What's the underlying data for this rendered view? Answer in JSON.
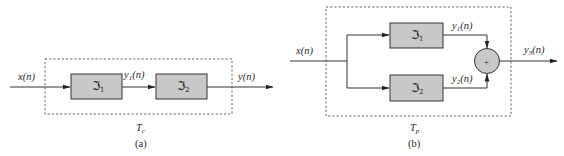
{
  "diagram_a": {
    "caption": "(a)",
    "system_label": "T",
    "system_label_sub": "c",
    "input_label": "x(n)",
    "intermediate_label": "y",
    "intermediate_sub": "1",
    "intermediate_suffix": "(n)",
    "output_label": "y(n)",
    "blocks": [
      {
        "symbol": "ℑ",
        "sub": "1"
      },
      {
        "symbol": "ℑ",
        "sub": "2"
      }
    ]
  },
  "diagram_b": {
    "caption": "(b)",
    "system_label": "T",
    "system_label_sub": "p",
    "input_label": "x(n)",
    "branch_outputs": [
      {
        "label": "y",
        "sub": "1",
        "suffix": "(n)"
      },
      {
        "label": "y",
        "sub": "2",
        "suffix": "(n)"
      }
    ],
    "output": {
      "label": "y",
      "sub": "3",
      "suffix": "(n)"
    },
    "summer_symbol": "+",
    "blocks": [
      {
        "symbol": "ℑ",
        "sub": "1"
      },
      {
        "symbol": "ℑ",
        "sub": "2"
      }
    ]
  },
  "colors": {
    "block_fill": "#c8c8c8",
    "line": "#333333",
    "background": "#ffffff"
  }
}
